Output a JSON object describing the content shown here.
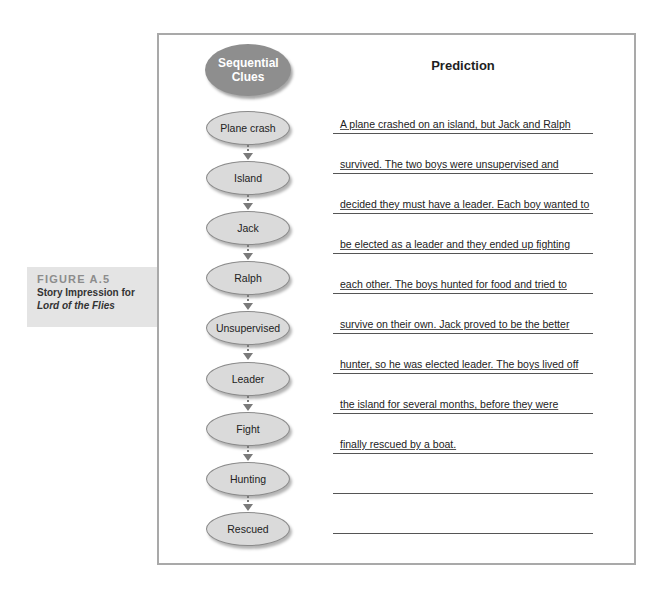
{
  "caption": {
    "figure_number": "FIGURE A.5",
    "title_line1": "Story Impression for",
    "title_line2": "Lord of the Flies"
  },
  "organizer": {
    "clues_header": "Sequential Clues",
    "prediction_header": "Prediction",
    "clues": [
      "Plane crash",
      "Island",
      "Jack",
      "Ralph",
      "Unsupervised",
      "Leader",
      "Fight",
      "Hunting",
      "Rescued"
    ],
    "prediction_lines": [
      "A plane crashed on an island, but Jack and Ralph",
      "survived. The two boys were unsupervised and",
      "decided they must have a leader. Each boy wanted to",
      "be elected as a leader and they ended up fighting",
      "each other. The boys hunted for food and tried to",
      "survive on their own. Jack proved to be the better",
      "hunter, so he was elected leader. The boys lived off",
      "the island for several months, before they were",
      "finally rescued by a boat.",
      ""
    ]
  },
  "colors": {
    "header_ellipse": "#8e8e8e",
    "clue_ellipse": "#dadada",
    "caption_box": "#e4e4e4",
    "frame_border": "#a9a9a9"
  }
}
